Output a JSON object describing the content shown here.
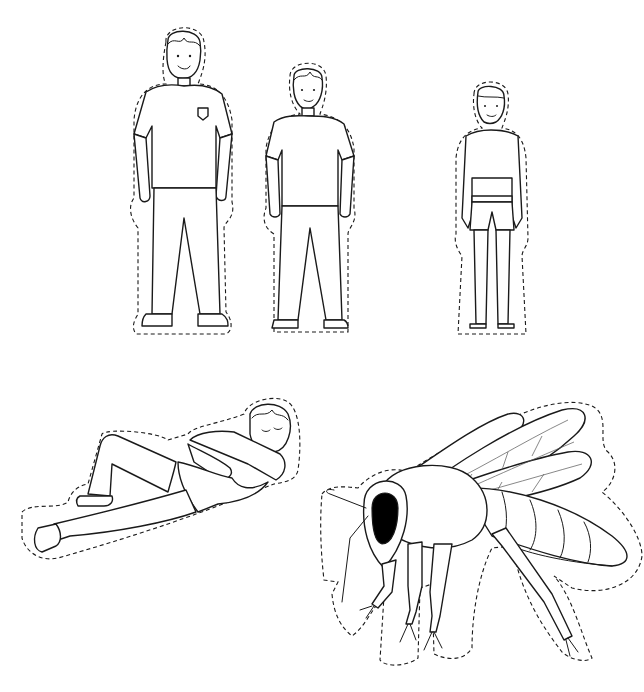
{
  "page": {
    "type": "cut-out worksheet illustration",
    "background": "#ffffff",
    "line_color": "#1a1a1a",
    "cut_line_style": "dashed"
  },
  "figures": [
    {
      "id": "tall-boy",
      "label": "Tall boy standing in t-shirt with pocket badge and long trousers",
      "icon": "person-standing-icon"
    },
    {
      "id": "medium-boy",
      "label": "Medium boy standing in t-shirt and long trousers",
      "icon": "person-standing-icon"
    },
    {
      "id": "small-boy",
      "label": "Small boy standing in shorts, barefoot",
      "icon": "person-standing-icon"
    },
    {
      "id": "lying-boy",
      "label": "Boy lying down, sleeping, head on arm",
      "icon": "person-lying-icon"
    },
    {
      "id": "bee",
      "label": "Honey bee side view with large black eye and veined wings",
      "icon": "bee-icon"
    }
  ]
}
